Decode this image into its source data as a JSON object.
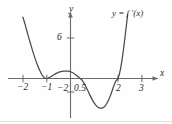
{
  "chart_data": {
    "type": "line",
    "title": "",
    "subtitle": "",
    "xlabel": "x",
    "ylabel": "y",
    "xlim": [
      -2.9,
      3.9
    ],
    "ylim": [
      -6.0,
      8.5
    ],
    "grid": false,
    "legend_position": "inside-top-right",
    "annotations": [
      {
        "text": "y = f ′(x)",
        "x": 1.8,
        "y": 8.0
      }
    ],
    "x_tick_labels": [
      "−2",
      "−1",
      "0.5",
      "2",
      "3"
    ],
    "x_tick_values": [
      -2,
      -1,
      0.5,
      2,
      3
    ],
    "y_tick_labels": [
      "6",
      "−2"
    ],
    "y_tick_values": [
      6,
      -2
    ],
    "series": [
      {
        "name": "y = f ′(x)",
        "color": "#4a4a4a",
        "x": [
          -2.0,
          -1.9,
          -1.8,
          -1.7,
          -1.6,
          -1.5,
          -1.4,
          -1.3,
          -1.2,
          -1.1,
          -1.0,
          -0.9,
          -0.8,
          -0.7,
          -0.6,
          -0.5,
          -0.4,
          -0.3,
          -0.2,
          -0.1,
          0.0,
          0.1,
          0.2,
          0.3,
          0.4,
          0.5,
          0.6,
          0.7,
          0.8,
          0.9,
          1.0,
          1.1,
          1.2,
          1.3,
          1.4,
          1.5,
          1.6,
          1.7,
          1.8,
          1.9,
          2.0,
          2.1,
          2.2,
          2.3,
          2.4
        ],
        "y": [
          9.1,
          7.9,
          6.6,
          5.4,
          4.2,
          3.1,
          2.1,
          1.25,
          0.55,
          0.1,
          0.0,
          0.12,
          0.32,
          0.56,
          0.76,
          0.92,
          1.02,
          1.08,
          1.1,
          1.08,
          1.0,
          0.84,
          0.6,
          0.32,
          0.02,
          -0.3,
          -0.9,
          -1.6,
          -2.35,
          -3.05,
          -3.65,
          -4.1,
          -4.35,
          -4.4,
          -4.25,
          -3.85,
          -3.2,
          -2.3,
          -1.3,
          -0.4,
          0.05,
          1.4,
          3.6,
          6.4,
          9.5
        ]
      }
    ],
    "axis_arrows": {
      "x_right": true,
      "y_up": true
    },
    "zeros": [
      -1,
      0.5,
      2
    ],
    "local_max": {
      "x": -0.2,
      "y": 1.1
    },
    "local_min": {
      "x": 1.3,
      "y": -4.4
    }
  },
  "labels": {
    "x_axis_name": "x",
    "y_axis_name": "y",
    "curve_label": "y = f ′(x)",
    "x_tick_m2": "−2",
    "x_tick_m1": "−1",
    "x_tick_05": "0.5",
    "x_tick_2": "2",
    "x_tick_3": "3",
    "y_tick_6": "6",
    "y_tick_m2": "−2"
  },
  "colors": {
    "curve": "#4a4a4a",
    "axis": "#6a6a6a",
    "text": "#2b2b2b",
    "background": "#fefefe"
  }
}
